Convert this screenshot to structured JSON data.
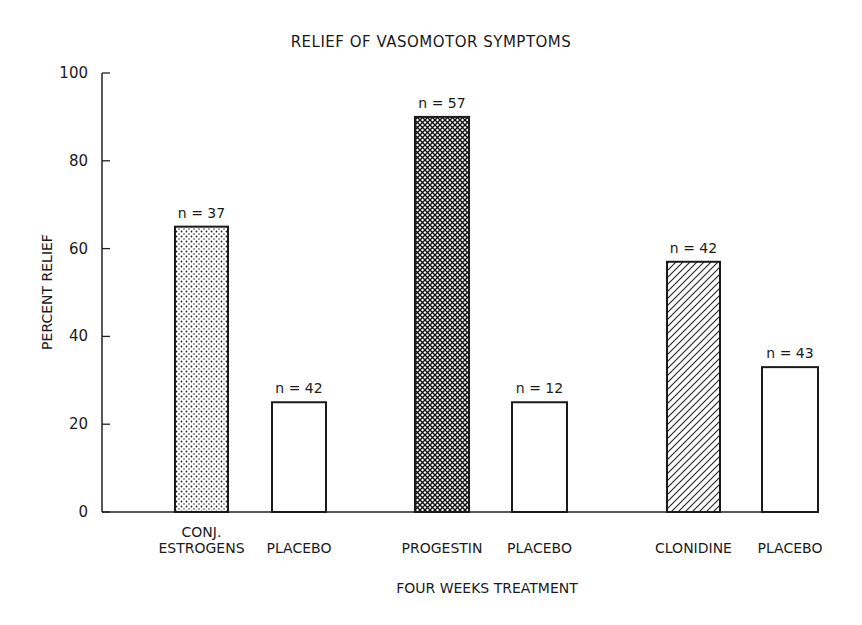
{
  "chart_data": {
    "type": "bar",
    "title": "RELIEF OF VASOMOTOR SYMPTOMS",
    "xlabel": "FOUR WEEKS TREATMENT",
    "ylabel": "PERCENT RELIEF",
    "ylim": [
      0,
      100
    ],
    "yticks": [
      0,
      20,
      40,
      60,
      80,
      100
    ],
    "grid": false,
    "legend": null,
    "categories": [
      "CONJ. ESTROGENS",
      "PLACEBO",
      "PROGESTIN",
      "PLACEBO",
      "CLONIDINE",
      "PLACEBO"
    ],
    "category_lines": [
      [
        "CONJ.",
        "ESTROGENS"
      ],
      [
        "PLACEBO"
      ],
      [
        "PROGESTIN"
      ],
      [
        "PLACEBO"
      ],
      [
        "CLONIDINE"
      ],
      [
        "PLACEBO"
      ]
    ],
    "values": [
      65,
      25,
      90,
      25,
      57,
      33
    ],
    "annotations": [
      "n = 37",
      "n = 42",
      "n = 57",
      "n = 12",
      "n = 42",
      "n = 43"
    ],
    "fills": [
      "dots",
      "none",
      "crosshatch",
      "none",
      "diagonal",
      "none"
    ]
  }
}
